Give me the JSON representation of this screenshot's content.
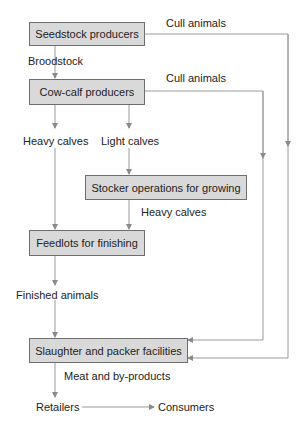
{
  "diagram": {
    "nodes": {
      "seedstock": "Seedstock producers",
      "cowcalf": "Cow-calf producers",
      "stocker": "Stocker operations for growing",
      "feedlots": "Feedlots for finishing",
      "slaughter": "Slaughter and packer facilities",
      "retailers": "Retailers",
      "consumers": "Consumers"
    },
    "edges": {
      "cull_seedstock": "Cull animals",
      "broodstock": "Broodstock",
      "cull_cowcalf": "Cull animals",
      "heavy_calves_1": "Heavy calves",
      "light_calves": "Light calves",
      "heavy_calves_2": "Heavy calves",
      "finished_animals": "Finished animals",
      "meat_byproducts": "Meat and by-products"
    },
    "colors": {
      "box_fill": "#d9d9d9",
      "box_border": "#6e6e6e",
      "line": "#9a9a9a"
    }
  }
}
